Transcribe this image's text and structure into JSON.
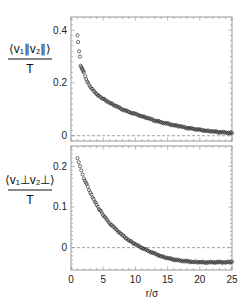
{
  "chart_data": [
    {
      "type": "scatter",
      "panel": "top",
      "ylabel_numerator": "⟨v₁∥v₂∥⟩",
      "ylabel_denominator": "T",
      "xlabel": "",
      "xlim": [
        0,
        25
      ],
      "ylim": [
        -0.02,
        0.45
      ],
      "yticks": [
        0,
        0.2,
        0.4
      ],
      "ytick_labels": [
        "0",
        "0.2",
        "0.4"
      ],
      "xticks": [
        0,
        5,
        10,
        15,
        20,
        25
      ],
      "xtick_labels": [],
      "reference_line": 0,
      "x": [
        1.0,
        1.1,
        1.25,
        1.4,
        1.5,
        1.6,
        1.7,
        1.8,
        1.9,
        2.0,
        2.2,
        2.5,
        3.0,
        3.5,
        4.0,
        4.5,
        5.0,
        6.0,
        7.0,
        8.0,
        9.0,
        10.0,
        11.0,
        12.0,
        13.0,
        14.0,
        15.0,
        16.0,
        17.0,
        18.0,
        19.0,
        20.0,
        21.0,
        22.0,
        23.0,
        24.0,
        25.0
      ],
      "values": [
        0.38,
        0.355,
        0.32,
        0.3,
        0.265,
        0.26,
        0.255,
        0.25,
        0.245,
        0.24,
        0.225,
        0.205,
        0.185,
        0.17,
        0.158,
        0.148,
        0.14,
        0.125,
        0.112,
        0.1,
        0.09,
        0.082,
        0.074,
        0.066,
        0.058,
        0.051,
        0.045,
        0.04,
        0.035,
        0.03,
        0.026,
        0.022,
        0.019,
        0.016,
        0.014,
        0.012,
        0.01
      ]
    },
    {
      "type": "scatter",
      "panel": "bottom",
      "ylabel_numerator": "⟨v₁⊥v₂⊥⟩",
      "ylabel_denominator": "T",
      "xlabel": "r/σ",
      "xlim": [
        0,
        25
      ],
      "ylim": [
        -0.055,
        0.25
      ],
      "yticks": [
        0,
        0.1,
        0.2
      ],
      "ytick_labels": [
        "0",
        "0.1",
        "0.2"
      ],
      "xticks": [
        0,
        5,
        10,
        15,
        20,
        25
      ],
      "xtick_labels": [
        "0",
        "5",
        "10",
        "15",
        "20",
        "25"
      ],
      "reference_line": 0,
      "x": [
        1.0,
        1.2,
        1.4,
        1.6,
        1.8,
        2.0,
        2.3,
        2.6,
        3.0,
        3.5,
        4.0,
        4.5,
        5.0,
        5.5,
        6.0,
        7.0,
        8.0,
        9.0,
        10.0,
        11.0,
        12.0,
        13.0,
        14.0,
        15.0,
        16.0,
        17.0,
        18.0,
        19.0,
        20.0,
        21.0,
        22.0,
        23.0,
        24.0,
        25.0
      ],
      "values": [
        0.22,
        0.21,
        0.2,
        0.19,
        0.18,
        0.17,
        0.16,
        0.15,
        0.135,
        0.12,
        0.105,
        0.092,
        0.08,
        0.07,
        0.06,
        0.045,
        0.03,
        0.018,
        0.008,
        0.0,
        -0.008,
        -0.015,
        -0.021,
        -0.026,
        -0.029,
        -0.032,
        -0.034,
        -0.035,
        -0.036,
        -0.036,
        -0.036,
        -0.036,
        -0.036,
        -0.035
      ]
    }
  ]
}
